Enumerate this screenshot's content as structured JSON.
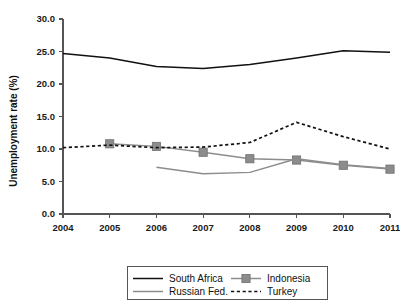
{
  "chart_data": {
    "type": "line",
    "title": "",
    "subtitle": "",
    "xlabel": "",
    "ylabel": "Unemployment rate (%)",
    "x": [
      2004,
      2005,
      2006,
      2007,
      2008,
      2009,
      2010,
      2011
    ],
    "categories": [
      "2004",
      "2005",
      "2006",
      "2007",
      "2008",
      "2009",
      "2010",
      "2011"
    ],
    "xtick_labels": [
      "2004",
      "2005",
      "2006",
      "2007",
      "2008",
      "2009",
      "2010",
      "2011"
    ],
    "ytick_labels": [
      "0.0",
      "5.0",
      "10.0",
      "15.0",
      "20.0",
      "25.0",
      "30.0"
    ],
    "ytick_values": [
      0.0,
      5.0,
      10.0,
      15.0,
      20.0,
      25.0,
      30.0
    ],
    "ylim": [
      0.0,
      30.0
    ],
    "xlim": [
      2004,
      2011
    ],
    "grid": false,
    "legend_position": "bottom",
    "series": [
      {
        "name": "South Africa",
        "style": "solid",
        "color": "#111111",
        "marker": "none",
        "x": [
          2004,
          2005,
          2006,
          2007,
          2008,
          2009,
          2010,
          2011
        ],
        "values": [
          24.7,
          24.0,
          22.7,
          22.4,
          23.0,
          24.0,
          25.1,
          24.9
        ]
      },
      {
        "name": "Indonesia",
        "style": "solid",
        "color": "#8c8c8c",
        "marker": "square",
        "x": [
          2005,
          2006,
          2007,
          2008,
          2009,
          2010,
          2011
        ],
        "values": [
          10.8,
          10.4,
          9.5,
          8.5,
          8.3,
          7.5,
          6.9
        ]
      },
      {
        "name": "Russian Fed.",
        "style": "solid",
        "color": "#8c8c8c",
        "marker": "none",
        "x": [
          2006,
          2007,
          2008,
          2009,
          2010,
          2011
        ],
        "values": [
          7.2,
          6.2,
          6.4,
          8.5,
          7.6,
          7.0
        ]
      },
      {
        "name": "Turkey",
        "style": "dashed",
        "color": "#111111",
        "marker": "none",
        "x": [
          2004,
          2005,
          2006,
          2007,
          2008,
          2009,
          2010,
          2011
        ],
        "values": [
          10.2,
          10.6,
          10.2,
          10.3,
          11.0,
          14.1,
          11.9,
          10.0
        ]
      }
    ],
    "legend": [
      {
        "label": "South Africa",
        "color": "#111111",
        "style": "solid",
        "marker": "none"
      },
      {
        "label": "Indonesia",
        "color": "#8c8c8c",
        "style": "solid",
        "marker": "square"
      },
      {
        "label": "Russian Fed.",
        "color": "#8c8c8c",
        "style": "solid",
        "marker": "none"
      },
      {
        "label": "Turkey",
        "color": "#111111",
        "style": "dashed",
        "marker": "none"
      }
    ]
  },
  "colors": {
    "axis": "#555555",
    "text": "#111111",
    "background": "#ffffff",
    "series_dark": "#111111",
    "series_gray": "#8c8c8c"
  }
}
